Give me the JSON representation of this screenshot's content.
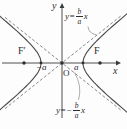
{
  "figure": {
    "title_semantic": "hyperbola with asymptotes diagram",
    "colors": {
      "ink": "#3a3a3a",
      "curve": "#4a4a4a",
      "dash": "#6a6a6a",
      "background": "#fdfdfd"
    },
    "labels": {
      "y_axis": "y",
      "x_axis": "x",
      "origin": "O",
      "focus_left": "F′",
      "focus_right": "F",
      "vertex_left": "−a",
      "vertex_right": "a"
    },
    "equations": {
      "top": {
        "lhs": "y=",
        "num": "b",
        "den": "a",
        "rhs": "x"
      },
      "bottom": {
        "lhs": "y=−",
        "num": "b",
        "den": "a",
        "rhs": "x"
      }
    },
    "geometry": {
      "origin_x": 62,
      "origin_y": 63,
      "a": 21,
      "b": 16.8,
      "focus_c": 38,
      "t_max": 1.95,
      "asym_x_min": 5,
      "asym_x_max": 121,
      "axis_x_start": 2,
      "axis_x_end": 116,
      "axis_y_start": 8,
      "axis_y_end": 118
    }
  }
}
